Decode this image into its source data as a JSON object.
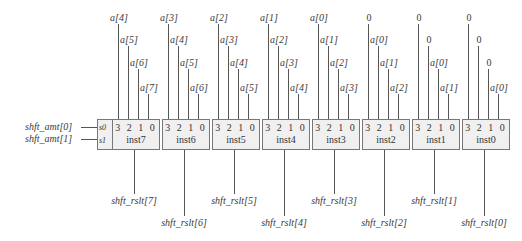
{
  "diagram": {
    "type": "barrel-shifter-mux-array",
    "select_inputs": [
      {
        "label": "shft_amt[0]",
        "port": "s0"
      },
      {
        "label": "shft_amt[1]",
        "port": "s1"
      }
    ],
    "port_labels": "3 2 1 0",
    "instances": [
      {
        "name": "inst7",
        "inputs": [
          "a[4]",
          "a[5]",
          "a[6]",
          "a[7]"
        ],
        "output": "shft_rslt[7]"
      },
      {
        "name": "inst6",
        "inputs": [
          "a[3]",
          "a[4]",
          "a[5]",
          "a[6]"
        ],
        "output": "shft_rslt[6]"
      },
      {
        "name": "inst5",
        "inputs": [
          "a[2]",
          "a[3]",
          "a[4]",
          "a[5]"
        ],
        "output": "shft_rslt[5]"
      },
      {
        "name": "inst4",
        "inputs": [
          "a[1]",
          "a[2]",
          "a[3]",
          "a[4]"
        ],
        "output": "shft_rslt[4]"
      },
      {
        "name": "inst3",
        "inputs": [
          "a[0]",
          "a[1]",
          "a[2]",
          "a[3]"
        ],
        "output": "shft_rslt[3]"
      },
      {
        "name": "inst2",
        "inputs": [
          "0",
          "a[0]",
          "a[1]",
          "a[2]"
        ],
        "output": "shft_rslt[2]"
      },
      {
        "name": "inst1",
        "inputs": [
          "0",
          "0",
          "a[0]",
          "a[1]"
        ],
        "output": "shft_rslt[1]"
      },
      {
        "name": "inst0",
        "inputs": [
          "0",
          "0",
          "0",
          "a[0]"
        ],
        "output": "shft_rslt[0]"
      }
    ],
    "colors": {
      "box_fill": "#f0f0f0",
      "box_border": "#777777",
      "wire": "#555555",
      "text": "#333333"
    }
  }
}
